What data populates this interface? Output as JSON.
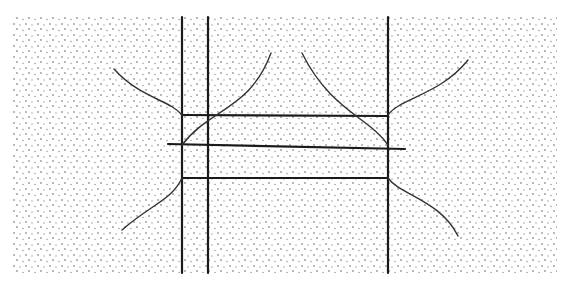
{
  "diagram": {
    "title": "",
    "background": "#ffffff",
    "stipple": {
      "color": "#9a9a9a",
      "region": {
        "x": 12,
        "y": 17,
        "width": 545,
        "height": 256
      },
      "dot_spacing": 6
    },
    "ink_color": "#1a1a1a",
    "vertical_lines": [
      {
        "id": "v1",
        "x": 182,
        "y1": 17,
        "y2": 273
      },
      {
        "id": "v2",
        "x": 208,
        "y1": 17,
        "y2": 273
      },
      {
        "id": "v3",
        "x": 388,
        "y1": 17,
        "y2": 273
      }
    ],
    "horizontal_lines": [
      {
        "id": "h1",
        "x1": 182,
        "y1": 115,
        "x2": 388,
        "y2": 116
      },
      {
        "id": "h2",
        "x1": 168,
        "y1": 144,
        "x2": 405,
        "y2": 149
      },
      {
        "id": "h3",
        "x1": 182,
        "y1": 178,
        "x2": 388,
        "y2": 178
      }
    ],
    "curves": [
      {
        "id": "c-top-left-outer",
        "d": "M114,69 C140,98 170,100 182,115"
      },
      {
        "id": "c-top-left-inner",
        "d": "M271,53 C250,110 210,108 182,145"
      },
      {
        "id": "c-top-right-inner",
        "d": "M302,53 C330,110 370,118 388,145"
      },
      {
        "id": "c-top-right-outer",
        "d": "M468,60 C440,95 400,98 388,115"
      },
      {
        "id": "c-bottom-left",
        "d": "M182,178 C172,200 150,205 122,230"
      },
      {
        "id": "c-bottom-right",
        "d": "M388,178 C400,195 440,200 458,236"
      }
    ]
  }
}
